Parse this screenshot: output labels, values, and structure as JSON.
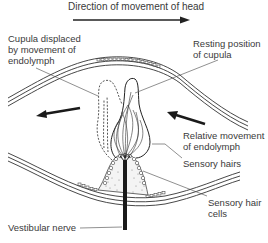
{
  "diagram": {
    "title": "Direction of movement of head",
    "labels": {
      "cupula_displaced": [
        "Cupula displaced",
        "by movement of",
        "endolymph"
      ],
      "resting_position": [
        "Resting position",
        "of cupula"
      ],
      "relative_movement": [
        "Relative movement",
        "of endolymph"
      ],
      "sensory_hairs": "Sensory hairs",
      "sensory_hair_cells": [
        "Sensory hair",
        "cells"
      ],
      "vestibular_nerve": "Vestibular nerve"
    },
    "arrows": [
      {
        "name": "head-direction-arrow",
        "direction": "right"
      },
      {
        "name": "displaced-endolymph-arrow",
        "direction": "left"
      },
      {
        "name": "relative-movement-arrow",
        "direction": "up-left"
      }
    ],
    "colors": {
      "line": "#2a2a2a",
      "text": "#3a3a3a",
      "background": "#ffffff"
    }
  }
}
